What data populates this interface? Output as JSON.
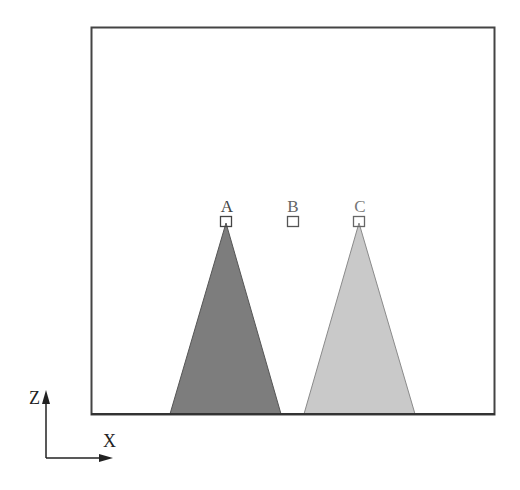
{
  "diagram": {
    "frame": {
      "x": 91,
      "y": 27,
      "width": 403,
      "height": 387,
      "stroke": "#444444"
    },
    "points": [
      {
        "label": "A",
        "x": 226,
        "y": 221
      },
      {
        "label": "B",
        "x": 292,
        "y": 221
      },
      {
        "label": "C",
        "x": 359,
        "y": 221
      }
    ],
    "triangles": [
      {
        "name": "left-cone",
        "apex": [
          226,
          223
        ],
        "base_left": 170,
        "base_right": 281,
        "base_y": 414,
        "fill": "#7d7d7d",
        "stroke": "#555555"
      },
      {
        "name": "right-cone",
        "apex": [
          359,
          223
        ],
        "base_left": 304,
        "base_right": 415,
        "base_y": 414,
        "fill": "#c9c9c9",
        "stroke": "#8a8a8a"
      }
    ],
    "axes": {
      "origin": [
        46,
        458
      ],
      "z_label": "Z",
      "x_label": "X"
    }
  }
}
